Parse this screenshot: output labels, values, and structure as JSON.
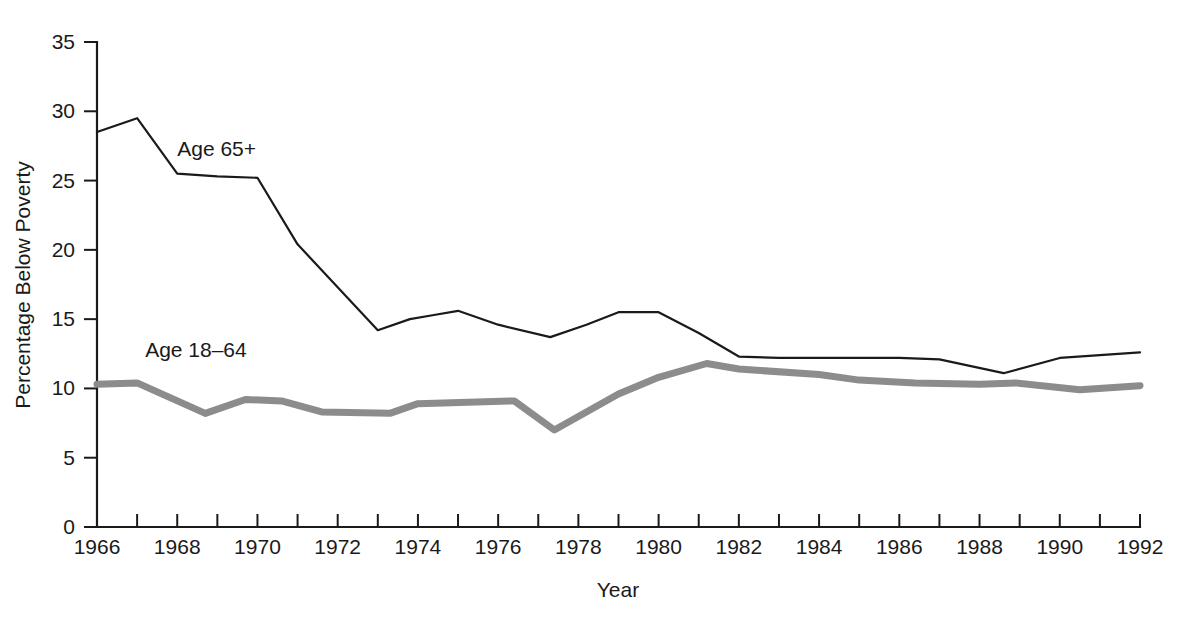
{
  "chart_data": {
    "type": "line",
    "title": "",
    "xlabel": "Year",
    "ylabel": "Percentage Below Poverty",
    "xlim": [
      1966,
      1992
    ],
    "ylim": [
      0,
      35
    ],
    "grid": false,
    "legend_position": "inline-annotation",
    "x_tick_labels": [
      "1966",
      "1968",
      "1970",
      "1972",
      "1974",
      "1976",
      "1978",
      "1980",
      "1982",
      "1984",
      "1986",
      "1988",
      "1990",
      "1992"
    ],
    "x_tick_values": [
      1966,
      1968,
      1970,
      1972,
      1974,
      1976,
      1978,
      1980,
      1982,
      1984,
      1986,
      1988,
      1990,
      1992
    ],
    "x_minor_ticks": [
      1966,
      1967,
      1968,
      1969,
      1970,
      1971,
      1972,
      1973,
      1974,
      1975,
      1976,
      1977,
      1978,
      1979,
      1980,
      1981,
      1982,
      1983,
      1984,
      1985,
      1986,
      1987,
      1988,
      1989,
      1990,
      1991,
      1992
    ],
    "y_tick_labels": [
      "0",
      "5",
      "10",
      "15",
      "20",
      "25",
      "30",
      "35"
    ],
    "y_tick_values": [
      0,
      5,
      10,
      15,
      20,
      25,
      30,
      35
    ],
    "series": [
      {
        "name": "Age 65+",
        "label": "Age 65+",
        "color": "#1a1a1a",
        "stroke_width": 2.2,
        "label_x": 1968.0,
        "label_y": 26.8,
        "x": [
          1966.0,
          1967.0,
          1968.0,
          1969.0,
          1970.0,
          1971.0,
          1973.0,
          1973.8,
          1974.4,
          1975.0,
          1976.0,
          1977.3,
          1978.2,
          1979.0,
          1980.0,
          1981.0,
          1982.0,
          1983.0,
          1986.0,
          1987.0,
          1988.6,
          1990.0,
          1992.0
        ],
        "y": [
          28.5,
          29.5,
          25.5,
          25.3,
          25.2,
          20.4,
          14.2,
          15.0,
          15.3,
          15.6,
          14.6,
          13.7,
          14.6,
          15.5,
          15.5,
          14.0,
          12.3,
          12.2,
          12.2,
          12.1,
          11.1,
          12.2,
          12.6
        ]
      },
      {
        "name": "Age 18-64",
        "label": "Age 18–64",
        "color": "#8c8c8c",
        "stroke_width": 7.0,
        "label_x": 1967.2,
        "label_y": 12.3,
        "x": [
          1966.0,
          1967.0,
          1968.7,
          1969.7,
          1970.6,
          1971.6,
          1973.3,
          1974.0,
          1976.4,
          1977.4,
          1979.0,
          1980.0,
          1981.2,
          1982.0,
          1984.0,
          1985.0,
          1986.4,
          1988.0,
          1988.9,
          1990.5,
          1992.0
        ],
        "y": [
          10.3,
          10.4,
          8.2,
          9.2,
          9.1,
          8.3,
          8.2,
          8.9,
          9.1,
          7.0,
          9.6,
          10.8,
          11.8,
          11.4,
          11.0,
          10.6,
          10.4,
          10.3,
          10.4,
          9.9,
          10.2
        ]
      }
    ]
  },
  "axis": {
    "x_title": "Year",
    "y_title": "Percentage Below Poverty"
  }
}
